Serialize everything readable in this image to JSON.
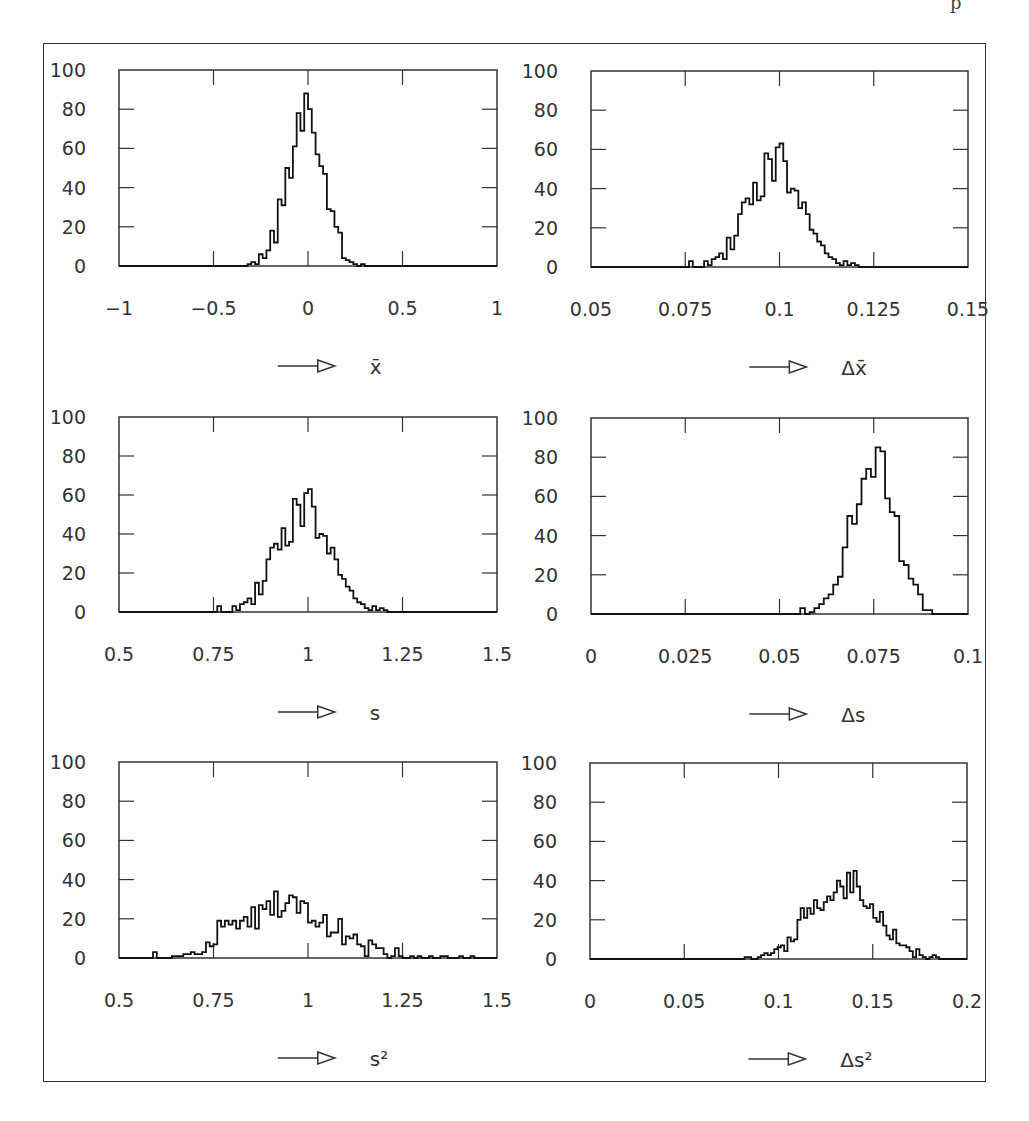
{
  "figure": {
    "frame_color": "#333333",
    "line_color": "#111111"
  },
  "chart_data": [
    {
      "type": "bar",
      "subtype": "histogram-step",
      "id": "xbar",
      "xlabel": "x̄",
      "xlabel_prefix_arrow": "⟶▷",
      "ylabel": "",
      "xlim": [
        -1,
        1
      ],
      "ylim": [
        0,
        100
      ],
      "xticks": [
        "-1",
        "-0.5",
        "0",
        "0.5",
        "1"
      ],
      "xtick_values": [
        -1,
        -0.5,
        0,
        0.5,
        1
      ],
      "yticks": [
        "0",
        "20",
        "40",
        "60",
        "80",
        "100"
      ],
      "grid": false,
      "bin_start": -0.32,
      "bin_width": 0.02,
      "values": [
        1,
        2,
        1,
        6,
        4,
        8,
        18,
        12,
        34,
        31,
        50,
        45,
        61,
        78,
        69,
        88,
        80,
        68,
        57,
        51,
        47,
        29,
        28,
        20,
        17,
        4,
        3,
        2,
        1,
        0,
        1
      ]
    },
    {
      "type": "bar",
      "subtype": "histogram-step",
      "id": "delta-xbar",
      "xlabel": "Δx̄",
      "xlabel_prefix_arrow": "⟶▷",
      "xlim": [
        0.05,
        0.15
      ],
      "ylim": [
        0,
        100
      ],
      "xticks": [
        "0.05",
        "0.075",
        "0.1",
        "0.125",
        "0.15"
      ],
      "xtick_values": [
        0.05,
        0.075,
        0.1,
        0.125,
        0.15
      ],
      "yticks": [
        "0",
        "20",
        "40",
        "60",
        "80",
        "100"
      ],
      "grid": false,
      "bin_start": 0.076,
      "bin_width": 0.001,
      "values": [
        3,
        0,
        0,
        0,
        3,
        1,
        4,
        5,
        7,
        4,
        15,
        9,
        16,
        27,
        33,
        35,
        32,
        43,
        34,
        36,
        58,
        55,
        44,
        61,
        63,
        54,
        38,
        40,
        39,
        30,
        33,
        27,
        19,
        17,
        13,
        11,
        7,
        5,
        4,
        2,
        1,
        3,
        1,
        2,
        1
      ]
    },
    {
      "type": "bar",
      "subtype": "histogram-step",
      "id": "s",
      "xlabel": "s",
      "xlabel_prefix_arrow": "⟶▷",
      "xlim": [
        0.5,
        1.5
      ],
      "ylim": [
        0,
        100
      ],
      "xticks": [
        "0.5",
        "0.75",
        "1",
        "1.25",
        "1.5"
      ],
      "xtick_values": [
        0.5,
        0.75,
        1,
        1.25,
        1.5
      ],
      "yticks": [
        "0",
        "20",
        "40",
        "60",
        "80",
        "100"
      ],
      "grid": false,
      "bin_start": 0.76,
      "bin_width": 0.01,
      "values": [
        3,
        0,
        0,
        0,
        3,
        1,
        4,
        5,
        7,
        4,
        15,
        9,
        16,
        27,
        33,
        35,
        32,
        43,
        34,
        36,
        58,
        55,
        44,
        61,
        63,
        54,
        38,
        40,
        39,
        30,
        33,
        27,
        19,
        17,
        13,
        11,
        7,
        5,
        4,
        2,
        1,
        3,
        1,
        2,
        1
      ]
    },
    {
      "type": "bar",
      "subtype": "histogram-step",
      "id": "delta-s",
      "xlabel": "Δs",
      "xlabel_prefix_arrow": "⟶▷",
      "xlim": [
        0,
        0.1
      ],
      "ylim": [
        0,
        100
      ],
      "xticks": [
        "0",
        "0.025",
        "0.05",
        "0.075",
        "0.1"
      ],
      "xtick_values": [
        0,
        0.025,
        0.05,
        0.075,
        0.1
      ],
      "yticks": [
        "0",
        "20",
        "40",
        "60",
        "80",
        "100"
      ],
      "grid": false,
      "bin_start": 0.0555,
      "bin_width": 0.00125,
      "values": [
        3,
        0,
        1,
        3,
        5,
        8,
        10,
        15,
        19,
        34,
        50,
        46,
        56,
        69,
        74,
        70,
        85,
        83,
        59,
        52,
        50,
        27,
        25,
        18,
        15,
        10,
        2,
        2,
        0
      ]
    },
    {
      "type": "bar",
      "subtype": "histogram-step",
      "id": "s-squared",
      "xlabel": "s²",
      "xlabel_prefix_arrow": "⟶▷",
      "xlim": [
        0.5,
        1.5
      ],
      "ylim": [
        0,
        100
      ],
      "xticks": [
        "0.5",
        "0.75",
        "1",
        "1.25",
        "1.5"
      ],
      "xtick_values": [
        0.5,
        0.75,
        1,
        1.25,
        1.5
      ],
      "yticks": [
        "0",
        "20",
        "40",
        "60",
        "80",
        "100"
      ],
      "grid": false,
      "bin_start": 0.59,
      "bin_width": 0.01,
      "values": [
        3,
        0,
        0,
        0,
        0,
        1,
        1,
        1,
        2,
        2,
        3,
        2,
        2,
        3,
        8,
        6,
        7,
        19,
        16,
        19,
        17,
        19,
        15,
        19,
        21,
        16,
        26,
        15,
        27,
        25,
        29,
        22,
        34,
        21,
        24,
        28,
        32,
        31,
        23,
        29,
        28,
        18,
        19,
        16,
        18,
        22,
        11,
        13,
        13,
        20,
        7,
        11,
        10,
        12,
        7,
        6,
        1,
        9,
        7,
        5,
        5,
        2,
        0,
        1,
        5,
        1,
        0,
        0,
        1,
        0,
        1,
        0,
        0,
        1,
        0,
        0,
        1,
        1,
        0,
        0,
        0,
        1,
        0,
        0,
        1,
        0,
        0,
        0,
        0
      ]
    },
    {
      "type": "bar",
      "subtype": "histogram-step",
      "id": "delta-s-squared",
      "xlabel": "Δs²",
      "xlabel_prefix_arrow": "⟶▷",
      "xlim": [
        0,
        0.2
      ],
      "ylim": [
        0,
        100
      ],
      "xticks": [
        "0",
        "0.05",
        "0.1",
        "0.15",
        "0.2"
      ],
      "xtick_values": [
        0,
        0.05,
        0.1,
        0.15,
        0.2
      ],
      "yticks": [
        "0",
        "20",
        "40",
        "60",
        "80",
        "100"
      ],
      "grid": false,
      "bin_start": 0.082,
      "bin_width": 0.00175,
      "values": [
        1,
        1,
        0,
        0,
        1,
        2,
        3,
        2,
        3,
        5,
        6,
        7,
        4,
        11,
        9,
        10,
        20,
        26,
        21,
        26,
        23,
        30,
        26,
        25,
        29,
        32,
        30,
        34,
        40,
        37,
        31,
        44,
        34,
        45,
        37,
        30,
        27,
        26,
        28,
        21,
        19,
        24,
        17,
        12,
        10,
        15,
        8,
        7,
        7,
        6,
        4,
        1,
        5,
        2,
        1,
        0,
        1,
        2,
        1
      ]
    }
  ]
}
